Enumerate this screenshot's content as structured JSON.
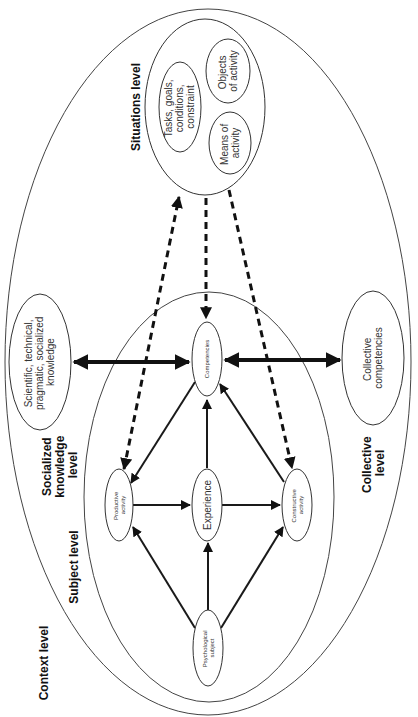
{
  "diagram": {
    "levels": {
      "situations": "Situations level",
      "socialized": [
        "Socialized",
        "knowledge",
        "level"
      ],
      "subject": "Subject level",
      "context": "Context level",
      "collective": [
        "Collective",
        "level"
      ]
    },
    "nodes": {
      "tasks": [
        "Tasks, goals,",
        "conditions,",
        "constraint"
      ],
      "objects": [
        "Objects",
        "of activity"
      ],
      "means": [
        "Means of",
        "activity"
      ],
      "competencies": "Competencies",
      "scientific": [
        "Scientific, technical,",
        "pragmatic, socialized",
        "knowledge"
      ],
      "collective_competencies": [
        "Collective",
        "competencies"
      ],
      "productive": [
        "Productive",
        "activity"
      ],
      "experience": "Experience",
      "constructive": [
        "Constructive",
        "activity"
      ],
      "psychological": [
        "Psychological",
        "subject"
      ]
    },
    "edges": [
      {
        "from": "psychological",
        "to": "productive",
        "style": "solid"
      },
      {
        "from": "psychological",
        "to": "experience",
        "style": "solid"
      },
      {
        "from": "psychological",
        "to": "constructive",
        "style": "solid"
      },
      {
        "from": "productive",
        "to": "experience",
        "style": "solid"
      },
      {
        "from": "experience",
        "to": "constructive",
        "style": "solid"
      },
      {
        "from": "experience",
        "to": "competencies",
        "style": "solid"
      },
      {
        "from": "constructive",
        "to": "competencies",
        "style": "solid"
      },
      {
        "from": "competencies",
        "to": "productive",
        "style": "solid"
      },
      {
        "from": "scientific",
        "to": "competencies",
        "style": "thick-bidirectional"
      },
      {
        "from": "competencies",
        "to": "collective_competencies",
        "style": "thick-bidirectional"
      },
      {
        "from": "productive",
        "to": "situations",
        "style": "dashed"
      },
      {
        "from": "situations",
        "to": "competencies",
        "style": "dashed"
      },
      {
        "from": "situations",
        "to": "constructive",
        "style": "dashed"
      }
    ]
  }
}
